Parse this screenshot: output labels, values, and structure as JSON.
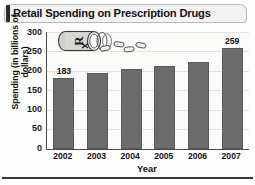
{
  "chart_title": "Retail Spending on Prescription Drugs",
  "axis": {
    "ylabel": "Spending (in billions of dollars)",
    "xlabel": "Year",
    "yticks": [
      "300",
      "250",
      "200",
      "150",
      "100",
      "50",
      "0"
    ]
  },
  "illustration": {
    "name": "rx-pill-bottle-icon",
    "symbol": "Rx"
  },
  "colors": {
    "bar_fill": "#6b6b6b",
    "bar_stroke": "#5a5a5a",
    "axis": "#4a4a4a",
    "gridline": "#e2e2df",
    "banner_bg": "#f2f2f0",
    "banner_edge": "#2b2b2b",
    "text": "#111111"
  },
  "chart_data": {
    "type": "bar",
    "title": "Retail Spending on Prescription Drugs",
    "xlabel": "Year",
    "ylabel": "Spending (in billions of dollars)",
    "categories": [
      "2002",
      "2003",
      "2004",
      "2005",
      "2006",
      "2007"
    ],
    "values": [
      183,
      196,
      205,
      213,
      224,
      259
    ],
    "point_labels": [
      "183",
      "",
      "",
      "",
      "",
      "259"
    ],
    "ylim": [
      0,
      300
    ],
    "ytick_step": 50,
    "grid": true,
    "legend": false
  }
}
